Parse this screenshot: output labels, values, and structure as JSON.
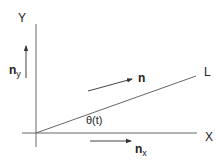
{
  "diagram": {
    "axes": {
      "x_label": "X",
      "y_label": "Y"
    },
    "line": {
      "label": "L"
    },
    "vectors": {
      "n": {
        "label": "n"
      },
      "n_x": {
        "label": "n",
        "subscript": "x"
      },
      "n_y": {
        "label": "n",
        "subscript": "y"
      }
    },
    "angle": {
      "label": "θ(t)"
    },
    "colors": {
      "stroke": "#555555",
      "text": "#222222"
    }
  }
}
